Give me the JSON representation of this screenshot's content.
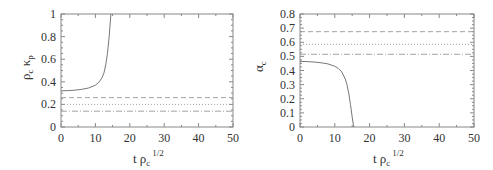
{
  "chart_data": [
    {
      "type": "line",
      "title": "",
      "xlabel": "t ρ_c^{1/2}",
      "ylabel": "ρ_c κ_p",
      "xlim": [
        0,
        50
      ],
      "ylim": [
        0,
        1
      ],
      "xticks": [
        0,
        10,
        20,
        30,
        40,
        50
      ],
      "yticks": [
        0,
        0.2,
        0.4,
        0.6,
        0.8,
        1
      ],
      "xtick_labels": [
        "0",
        "10",
        "20",
        "30",
        "40",
        "50"
      ],
      "ytick_labels": [
        "0",
        "0.2",
        "0.4",
        "0.6",
        "0.8",
        "1"
      ],
      "grid": false,
      "legend": null,
      "series": [
        {
          "name": "solid curve (diverging)",
          "style": "solid",
          "x": [
            0,
            2,
            4,
            6,
            8,
            10,
            11,
            12,
            12.5,
            13,
            13.5,
            14,
            14.3,
            14.5
          ],
          "y": [
            0.32,
            0.322,
            0.326,
            0.333,
            0.345,
            0.37,
            0.395,
            0.44,
            0.48,
            0.55,
            0.65,
            0.8,
            0.92,
            1.0
          ]
        },
        {
          "name": "horizontal line 1",
          "style": "dashed",
          "x": [
            0,
            50
          ],
          "y": [
            0.26,
            0.26
          ]
        },
        {
          "name": "horizontal line 2",
          "style": "dotted",
          "x": [
            0,
            50
          ],
          "y": [
            0.2,
            0.2
          ]
        },
        {
          "name": "horizontal line 3",
          "style": "dash-dot",
          "x": [
            0,
            50
          ],
          "y": [
            0.14,
            0.14
          ]
        }
      ]
    },
    {
      "type": "line",
      "title": "",
      "xlabel": "t ρ_c^{1/2}",
      "ylabel": "α_c",
      "xlim": [
        0,
        50
      ],
      "ylim": [
        0,
        0.8
      ],
      "xticks": [
        0,
        10,
        20,
        30,
        40,
        50
      ],
      "yticks": [
        0,
        0.1,
        0.2,
        0.3,
        0.4,
        0.5,
        0.6,
        0.7,
        0.8
      ],
      "xtick_labels": [
        "0",
        "10",
        "20",
        "30",
        "40",
        "50"
      ],
      "ytick_labels": [
        "0",
        "0.1",
        "0.2",
        "0.3",
        "0.4",
        "0.5",
        "0.6",
        "0.7",
        "0.8"
      ],
      "grid": false,
      "legend": null,
      "series": [
        {
          "name": "solid curve (collapsing)",
          "style": "solid",
          "x": [
            0,
            2,
            4,
            6,
            8,
            10,
            11,
            12,
            13,
            13.5,
            14,
            14.5,
            15,
            15.3,
            15.5
          ],
          "y": [
            0.465,
            0.463,
            0.46,
            0.455,
            0.447,
            0.43,
            0.415,
            0.39,
            0.34,
            0.3,
            0.24,
            0.16,
            0.07,
            0.02,
            0.0
          ]
        },
        {
          "name": "horizontal line 1",
          "style": "dashed",
          "x": [
            0,
            50
          ],
          "y": [
            0.675,
            0.675
          ]
        },
        {
          "name": "horizontal line 2",
          "style": "dotted",
          "x": [
            0,
            50
          ],
          "y": [
            0.585,
            0.585
          ]
        },
        {
          "name": "horizontal line 3",
          "style": "dash-dot",
          "x": [
            0,
            50
          ],
          "y": [
            0.515,
            0.515
          ]
        }
      ]
    }
  ],
  "labels": {
    "left": {
      "ylabel_main1": "ρ",
      "ylabel_sub1": "c",
      "ylabel_main2": "κ",
      "ylabel_sub2": "p",
      "xlabel_t": "t ρ",
      "xlabel_sub": "c",
      "xlabel_sup": "1/2"
    },
    "right": {
      "ylabel_main": "α",
      "ylabel_sub": "c",
      "xlabel_t": "t ρ",
      "xlabel_sub": "c",
      "xlabel_sup": "1/2"
    }
  }
}
